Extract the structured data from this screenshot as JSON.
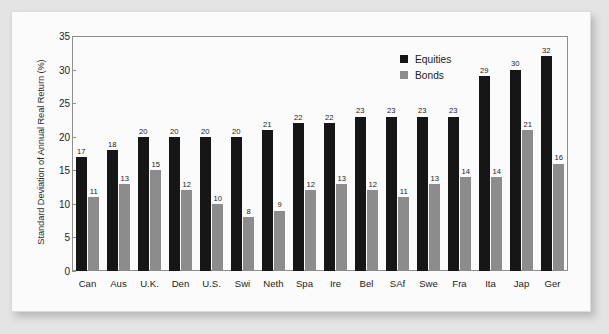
{
  "chart_data": {
    "type": "bar",
    "title": "",
    "xlabel": "",
    "ylabel": "Standard Deviation of Annual Real Return (%)",
    "ylim": [
      0,
      35
    ],
    "yticks": [
      0,
      5,
      10,
      15,
      20,
      25,
      30,
      35
    ],
    "grid": false,
    "legend_position": "top-right",
    "categories": [
      "Can",
      "Aus",
      "U.K.",
      "Den",
      "U.S.",
      "Swi",
      "Neth",
      "Spa",
      "Ire",
      "Bel",
      "SAf",
      "Swe",
      "Fra",
      "Ita",
      "Jap",
      "Ger"
    ],
    "series": [
      {
        "name": "Equities",
        "color": "#161616",
        "values": [
          17,
          18,
          20,
          20,
          20,
          20,
          21,
          22,
          22,
          23,
          23,
          23,
          23,
          29,
          30,
          32
        ]
      },
      {
        "name": "Bonds",
        "color": "#8c8c8c",
        "values": [
          11,
          13,
          15,
          12,
          10,
          8,
          9,
          12,
          13,
          12,
          11,
          13,
          14,
          14,
          21,
          16
        ]
      }
    ]
  },
  "legend": {
    "items": [
      {
        "label": "Equities",
        "color": "#161616"
      },
      {
        "label": "Bonds",
        "color": "#8c8c8c"
      }
    ]
  },
  "page": {
    "background_color": "#e4e4e4",
    "card_color": "#fbfbfb",
    "axis_color": "#8e8e8e"
  }
}
